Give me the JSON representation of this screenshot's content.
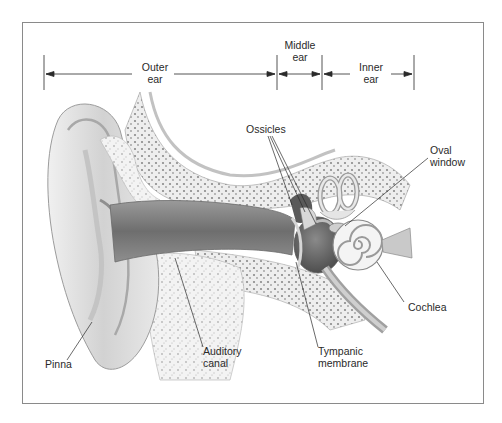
{
  "figure": {
    "type": "anatomical-diagram",
    "regions": [
      {
        "id": "outer",
        "line1": "Outer",
        "line2": "ear",
        "x_start": 44,
        "x_end": 277
      },
      {
        "id": "middle",
        "line1": "Middle",
        "line2": "ear",
        "x_start": 277,
        "x_end": 322
      },
      {
        "id": "inner",
        "line1": "Inner",
        "line2": "ear",
        "x_start": 322,
        "x_end": 414
      }
    ],
    "labels": {
      "ossicles": "Ossicles",
      "oval_window_1": "Oval",
      "oval_window_2": "window",
      "cochlea": "Cochlea",
      "pinna": "Pinna",
      "auditory_canal_1": "Auditory",
      "auditory_canal_2": "canal",
      "tympanic_1": "Tympanic",
      "tympanic_2": "membrane"
    },
    "colors": {
      "frame": "#8a8a8a",
      "line": "#2a2a2a",
      "skin_light": "#e6e6e6",
      "skin_mid": "#bdbdbd",
      "skin_dark": "#7a7a7a",
      "bone": "#f2f2f2",
      "bone_speckle": "#9a9a9a"
    }
  }
}
